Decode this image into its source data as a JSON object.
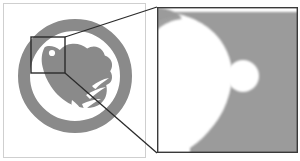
{
  "figure": {
    "type": "magnified-detail-comparison",
    "background_color": "#ffffff",
    "width": 300,
    "height": 161
  },
  "source_panel": {
    "name": "Original logo panel",
    "x": 3,
    "y": 3,
    "width": 143,
    "height": 155,
    "background_color": "#ffffff",
    "border_color": "#cfcfcf",
    "border_width": 1
  },
  "logo": {
    "name": "bird-in-ring-logo",
    "ink_color": "#8a8a8a",
    "ring": {
      "center_x": 75,
      "center_y": 76,
      "outer_radius": 57,
      "inner_radius": 45,
      "thickness": 12
    },
    "bird": {
      "name": "bird-silhouette",
      "eye": {
        "center_x": 52,
        "center_y": 53,
        "radius": 3.1,
        "color": "#ffffff"
      }
    }
  },
  "selection_box": {
    "name": "region-of-interest",
    "x": 31,
    "y": 37,
    "width": 34,
    "height": 36,
    "stroke_color": "#2b2b2b",
    "stroke_width": 1.4,
    "fill": "none"
  },
  "callout_lines": {
    "stroke_color": "#2b2b2b",
    "stroke_width": 1.3,
    "top": {
      "x1": 65,
      "y1": 37,
      "x2": 157,
      "y2": 7
    },
    "bottom": {
      "x1": 65,
      "y1": 73,
      "x2": 157,
      "y2": 153
    }
  },
  "magnified_panel": {
    "name": "magnified-detail-panel",
    "x": 157,
    "y": 7,
    "width": 141,
    "height": 146,
    "border_color": "#3a3a3a",
    "border_width": 1.4,
    "background_color": "#ffffff",
    "ink_color": "#8a8a8a",
    "texture": "halftone-dither",
    "zoom_factor": "approx 4x",
    "eye_highlight": {
      "center_x": 243,
      "center_y": 76,
      "radius": 16,
      "color": "#ffffff"
    }
  },
  "chart_data": {
    "type": "table",
    "columns": [
      "region",
      "rendered_tone",
      "texture"
    ],
    "rows": [
      [
        "page background",
        "#ffffff",
        "solid"
      ],
      [
        "logo ink (original scale)",
        "#8a8a8a",
        "solid-appearing"
      ],
      [
        "logo ink (magnified)",
        "#8a8a8a",
        "halftone-dither"
      ],
      [
        "bird eye",
        "#ffffff",
        "solid"
      ]
    ]
  }
}
